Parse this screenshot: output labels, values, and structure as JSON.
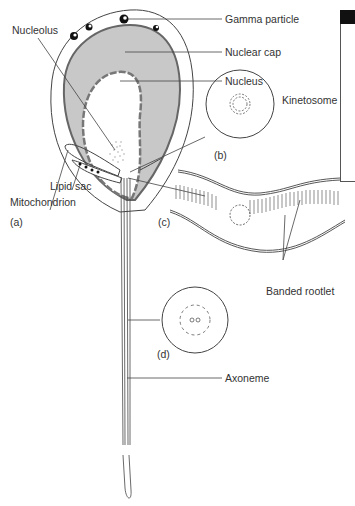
{
  "figure": {
    "panels": {
      "a": "(a)",
      "b": "(b)",
      "c": "(c)",
      "d": "(d)"
    },
    "labels": {
      "gamma_particle": "Gamma particle",
      "nucleolus": "Nucleolus",
      "nuclear_cap": "Nuclear cap",
      "nucleus": "Nucleus",
      "kinetosome": "Kinetosome",
      "lipid_sac": "Lipid sac",
      "mitochondrion": "Mitochondrion",
      "banded_rootlet": "Banded rootlet",
      "axoneme": "Axoneme"
    },
    "colors": {
      "line": "#333333",
      "nuclear_cap_fill": "#c8c8c8",
      "background": "#ffffff"
    }
  }
}
